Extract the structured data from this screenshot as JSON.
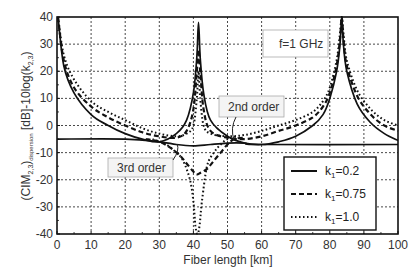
{
  "chart_data": {
    "type": "line",
    "title": "",
    "xlabel": "Fiber length [km]",
    "ylabel": "(CIM2,3)dispersion [dB]-10log(k2,3)",
    "ylabel_parts": {
      "main": "(CIM",
      "sub1": "2,3",
      "close": ")",
      "sub2": "dispersion",
      "tail": " [dB]-10log(k",
      "sub3": "2,3",
      "end": ")"
    },
    "xlim": [
      0,
      100
    ],
    "ylim": [
      -40,
      40
    ],
    "xticks": [
      0,
      10,
      20,
      30,
      40,
      50,
      60,
      70,
      80,
      90,
      100
    ],
    "yticks": [
      40,
      30,
      20,
      10,
      0,
      -10,
      -20,
      -30,
      -40
    ],
    "grid": true,
    "legend_position": "lower right",
    "annotations": [
      {
        "text": "f=1 GHz",
        "x": 60,
        "y": 32.5
      },
      {
        "text": "2nd order",
        "x": 47.5,
        "y": 8.5
      },
      {
        "text": "3rd order",
        "x": 15,
        "y": -11.5
      }
    ],
    "series": [
      {
        "name": "k1=0.2",
        "style": "solid",
        "second_order": {
          "x": [
            0.3,
            2,
            5,
            10,
            15,
            20,
            25,
            30,
            35,
            38,
            40,
            41,
            41.5,
            42,
            43,
            45,
            50,
            55,
            60,
            65,
            70,
            75,
            78,
            80,
            82,
            83,
            83.5,
            84,
            85,
            88,
            92,
            96,
            100
          ],
          "y": [
            40,
            22,
            12,
            4,
            0,
            -3,
            -5,
            -6,
            -3,
            2,
            12,
            25,
            38,
            25,
            12,
            2,
            -4,
            -6.5,
            -7,
            -6,
            -4,
            0,
            4,
            10,
            20,
            30,
            40,
            30,
            20,
            8,
            1,
            -3,
            -5.5
          ]
        },
        "third_order": {
          "x": [
            0,
            20,
            30,
            35,
            40,
            45,
            50,
            55,
            60,
            100
          ],
          "y": [
            -5,
            -5,
            -6,
            -7,
            -7.5,
            -7,
            -6.5,
            -6.5,
            -7,
            -7
          ]
        }
      },
      {
        "name": "k1=0.75",
        "style": "dashed",
        "second_order": {
          "x": [
            0.3,
            2,
            5,
            10,
            15,
            20,
            25,
            30,
            35,
            38,
            40,
            41,
            41.5,
            42,
            43,
            45,
            50,
            55,
            60,
            65,
            70,
            75,
            78,
            80,
            82,
            83,
            83.5,
            84,
            85,
            88,
            92,
            96,
            100
          ],
          "y": [
            40,
            24,
            14,
            7,
            3,
            0,
            -2.5,
            -4,
            -4.5,
            -2,
            6,
            20,
            28,
            20,
            6,
            -2,
            -4.5,
            -5,
            -4,
            -2,
            0,
            3,
            7,
            12,
            22,
            32,
            40,
            32,
            22,
            11,
            4,
            0,
            -2
          ]
        },
        "third_order": {
          "x": [
            26,
            30,
            33,
            36,
            38,
            40,
            41,
            42,
            44,
            46,
            48,
            50,
            52,
            55
          ],
          "y": [
            -5,
            -6,
            -8,
            -11,
            -14,
            -17,
            -18,
            -17.5,
            -16,
            -13,
            -10,
            -7,
            -5,
            -4.5
          ]
        }
      },
      {
        "name": "k1=1.0",
        "style": "dotted",
        "second_order": {
          "x": [
            0.3,
            2,
            5,
            10,
            15,
            20,
            25,
            30,
            35,
            38,
            40,
            41,
            41.5,
            42,
            43,
            45,
            50,
            55,
            60,
            65,
            70,
            75,
            78,
            80,
            82,
            83,
            83.5,
            84,
            85,
            88,
            92,
            96,
            100
          ],
          "y": [
            40,
            26,
            17,
            9,
            5,
            2,
            -1,
            -3,
            -4,
            -3,
            0,
            10,
            20,
            10,
            0,
            -3,
            -4,
            -3.5,
            -2,
            0,
            2,
            5,
            9,
            14,
            24,
            34,
            40,
            34,
            24,
            13,
            6,
            2,
            0
          ]
        },
        "third_order": {
          "x": [
            28,
            32,
            35,
            37,
            39,
            40,
            40.6,
            41.2,
            41.8,
            42.5,
            44,
            46,
            48,
            50,
            53
          ],
          "y": [
            -5,
            -7,
            -10,
            -13,
            -20,
            -28,
            -37,
            -40,
            -37,
            -28,
            -15,
            -10,
            -7,
            -5,
            -4
          ]
        }
      }
    ]
  },
  "legend": {
    "items": [
      {
        "label": "k",
        "sub": "1",
        "value": "=0.2",
        "style": "solid"
      },
      {
        "label": "k",
        "sub": "1",
        "value": "=0.75",
        "style": "dashed"
      },
      {
        "label": "k",
        "sub": "1",
        "value": "=1.0",
        "style": "dotted"
      }
    ]
  },
  "colors": {
    "line": "#111111",
    "grid": "#333333",
    "frame": "#111111",
    "box_border": "#999999",
    "box_fill": "#f2f2f2"
  }
}
